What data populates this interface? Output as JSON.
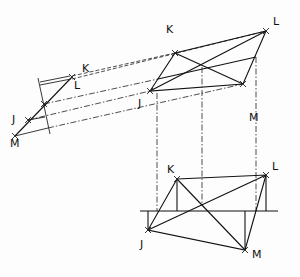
{
  "diagram": {
    "type": "descriptive-geometry-projection",
    "views": [
      {
        "name": "edge-view",
        "labels": {
          "K": "K",
          "L": "L",
          "J": "J",
          "M": "M"
        }
      },
      {
        "name": "oblique-view",
        "labels": {
          "K": "K",
          "L": "L",
          "J": "J",
          "M": "M"
        }
      },
      {
        "name": "base-view",
        "labels": {
          "K": "K",
          "L": "L",
          "J": "J",
          "M": "M"
        }
      }
    ],
    "line_styles": [
      "solid",
      "dash-dot projector",
      "dashed projector"
    ],
    "stroke_color": "#111111",
    "background": "#fdfdfd"
  }
}
